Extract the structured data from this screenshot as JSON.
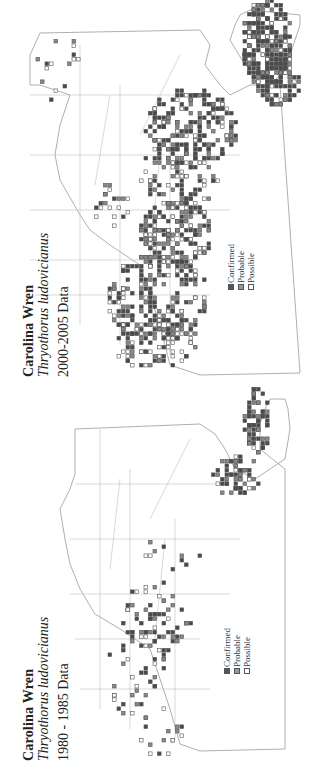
{
  "panels": [
    {
      "id": "2000-2005",
      "title": "Carolina Wren",
      "scientific_name": "Thryothorus ludovicianus",
      "period": "2000-2005 Data",
      "legend": [
        {
          "label": "Confirmed",
          "key": "confirmed"
        },
        {
          "label": "Probable",
          "key": "probable"
        },
        {
          "label": "Possible",
          "key": "possible"
        }
      ],
      "density": "high",
      "clusters": [
        {
          "u": 340,
          "v": 265,
          "ru": 45,
          "rv": 25,
          "n": 260,
          "w": [
            0.6,
            0.3,
            0.1
          ]
        },
        {
          "u": 300,
          "v": 275,
          "ru": 25,
          "rv": 22,
          "n": 90,
          "w": [
            0.6,
            0.3,
            0.1
          ]
        },
        {
          "u": 255,
          "v": 190,
          "ru": 40,
          "rv": 45,
          "n": 200,
          "w": [
            0.55,
            0.3,
            0.15
          ]
        },
        {
          "u": 210,
          "v": 180,
          "ru": 35,
          "rv": 40,
          "n": 90,
          "w": [
            0.4,
            0.3,
            0.3
          ]
        },
        {
          "u": 150,
          "v": 175,
          "ru": 35,
          "rv": 35,
          "n": 180,
          "w": [
            0.5,
            0.3,
            0.2
          ]
        },
        {
          "u": 85,
          "v": 155,
          "ru": 45,
          "rv": 50,
          "n": 200,
          "w": [
            0.5,
            0.3,
            0.2
          ]
        },
        {
          "u": 40,
          "v": 150,
          "ru": 25,
          "rv": 45,
          "n": 90,
          "w": [
            0.4,
            0.3,
            0.3
          ]
        },
        {
          "u": 180,
          "v": 110,
          "ru": 25,
          "rv": 20,
          "n": 20,
          "w": [
            0.3,
            0.3,
            0.4
          ]
        },
        {
          "u": 310,
          "v": 60,
          "ru": 40,
          "rv": 25,
          "n": 15,
          "w": [
            0.3,
            0.3,
            0.4
          ]
        }
      ]
    },
    {
      "id": "1980-1985",
      "title": "Carolina Wren",
      "scientific_name": "Thryothorus ludovicianus",
      "period": "1980 - 1985 Data",
      "legend": [
        {
          "label": "Confirmed",
          "key": "confirmed"
        },
        {
          "label": "Probable",
          "key": "probable"
        },
        {
          "label": "Possible",
          "key": "possible"
        }
      ],
      "density": "low",
      "clusters": [
        {
          "u": 345,
          "v": 255,
          "ru": 35,
          "rv": 12,
          "n": 70,
          "w": [
            0.6,
            0.3,
            0.1
          ]
        },
        {
          "u": 290,
          "v": 235,
          "ru": 22,
          "rv": 22,
          "n": 60,
          "w": [
            0.6,
            0.3,
            0.1
          ]
        },
        {
          "u": 150,
          "v": 155,
          "ru": 35,
          "rv": 35,
          "n": 60,
          "w": [
            0.5,
            0.3,
            0.2
          ]
        },
        {
          "u": 110,
          "v": 135,
          "ru": 25,
          "rv": 30,
          "n": 25,
          "w": [
            0.4,
            0.3,
            0.3
          ]
        },
        {
          "u": 70,
          "v": 140,
          "ru": 25,
          "rv": 30,
          "n": 20,
          "w": [
            0.3,
            0.3,
            0.4
          ]
        },
        {
          "u": 30,
          "v": 160,
          "ru": 20,
          "rv": 25,
          "n": 14,
          "w": [
            0.3,
            0.3,
            0.4
          ]
        },
        {
          "u": 220,
          "v": 170,
          "ru": 30,
          "rv": 30,
          "n": 10,
          "w": [
            0.3,
            0.3,
            0.4
          ]
        }
      ]
    }
  ],
  "colors": {
    "confirmed": "#4a4a4a",
    "probable": "#8a8a8a",
    "possible": "#ffffff",
    "border": "#555555",
    "county_lines": "#b0b0b0"
  }
}
